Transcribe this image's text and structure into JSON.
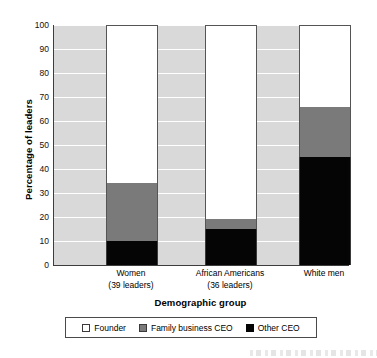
{
  "chart_data": {
    "type": "bar",
    "subtype": "stacked-bar",
    "title": "",
    "xlabel": "Demographic group",
    "ylabel": "Percentage of leaders",
    "ylim": [
      0,
      100
    ],
    "yticks": [
      0,
      10,
      20,
      30,
      40,
      50,
      60,
      70,
      80,
      90,
      100
    ],
    "grid": true,
    "legend_position": "bottom",
    "categories": [
      "Women",
      "African Americans",
      "White men"
    ],
    "category_sublabels": [
      "(39 leaders)",
      "(36 leaders)",
      ""
    ],
    "series": [
      {
        "name": "Founder",
        "color": "#ffffff",
        "values": [
          66,
          81,
          34
        ]
      },
      {
        "name": "Family business CEO",
        "color": "#7a7a7a",
        "values": [
          24,
          4,
          21
        ]
      },
      {
        "name": "Other CEO",
        "color": "#050505",
        "values": [
          10,
          15,
          45
        ]
      }
    ],
    "stack_boundaries": [
      {
        "category": "Women",
        "other_ceo_top": 10,
        "family_business_top": 34,
        "founder_top": 100
      },
      {
        "category": "African Americans",
        "other_ceo_top": 15,
        "family_business_top": 19,
        "founder_top": 100
      },
      {
        "category": "White men",
        "other_ceo_top": 45,
        "family_business_top": 66,
        "founder_top": 100
      }
    ]
  },
  "axes": {
    "y_title": "Percentage of leaders",
    "x_title": "Demographic group",
    "y_tick_labels": [
      "100",
      "90",
      "80",
      "70",
      "60",
      "50",
      "40",
      "30",
      "20",
      "10",
      "0"
    ]
  },
  "categories": [
    {
      "label": "Women",
      "sub": "(39 leaders)"
    },
    {
      "label": "African Americans",
      "sub": "(36 leaders)"
    },
    {
      "label": "White men",
      "sub": ""
    }
  ],
  "legend": {
    "items": [
      {
        "label": "Founder",
        "swatch": "white-square-swatch"
      },
      {
        "label": "Family business CEO",
        "swatch": "gray-square-swatch"
      },
      {
        "label": "Other CEO",
        "swatch": "black-square-swatch"
      }
    ]
  },
  "colors": {
    "plot_background": "#d9d9d9",
    "gridline": "#ffffff",
    "founder": "#ffffff",
    "family_business_ceo": "#7a7a7a",
    "other_ceo": "#050505",
    "axis": "#3d3d3d"
  }
}
